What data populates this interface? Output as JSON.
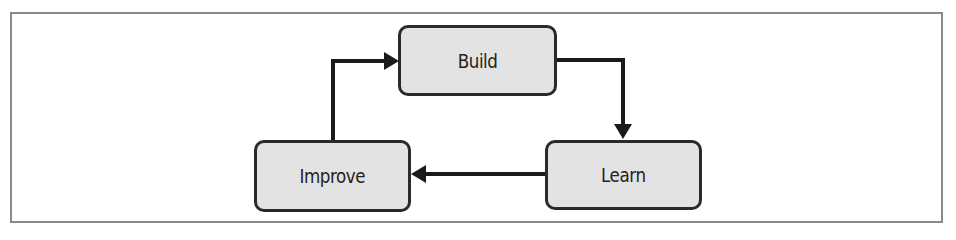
{
  "diagram": {
    "type": "cycle",
    "nodes": [
      {
        "id": "build",
        "label": "Build"
      },
      {
        "id": "learn",
        "label": "Learn"
      },
      {
        "id": "improve",
        "label": "Improve"
      }
    ],
    "edges": [
      {
        "from": "build",
        "to": "learn"
      },
      {
        "from": "learn",
        "to": "improve"
      },
      {
        "from": "improve",
        "to": "build"
      }
    ],
    "colors": {
      "node_fill": "#e3e3e3",
      "node_border": "#2a2a2a",
      "edge": "#1a1a1a",
      "frame": "#8a8a8a"
    }
  }
}
